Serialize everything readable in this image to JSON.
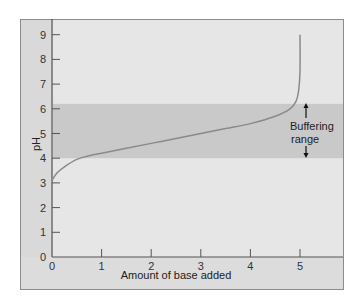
{
  "chart_data": {
    "type": "line",
    "title": "",
    "xlabel": "Amount of base added",
    "ylabel": "pH",
    "xlim": [
      0,
      5.5
    ],
    "ylim": [
      0,
      9.5
    ],
    "x_ticks": [
      "0",
      "1",
      "2",
      "3",
      "4",
      "5"
    ],
    "y_ticks": [
      "0",
      "1",
      "2",
      "3",
      "4",
      "5",
      "6",
      "7",
      "8",
      "9"
    ],
    "grid": false,
    "legend": null,
    "series": [
      {
        "name": "Titration curve",
        "x": [
          0,
          0.1,
          0.25,
          0.5,
          0.75,
          1.0,
          1.5,
          2.0,
          2.5,
          3.0,
          3.5,
          4.0,
          4.5,
          4.8,
          4.92,
          4.97,
          5.0,
          5.0
        ],
        "y": [
          3.1,
          3.4,
          3.65,
          3.95,
          4.1,
          4.2,
          4.4,
          4.6,
          4.8,
          5.0,
          5.2,
          5.4,
          5.7,
          6.0,
          6.3,
          6.7,
          7.5,
          9.0
        ]
      }
    ],
    "shaded_region": {
      "label": "Buffering range",
      "y_from": 4.0,
      "y_to": 6.2
    },
    "annotations": [
      "Buffering",
      "range"
    ]
  },
  "labels": {
    "ylabel": "pH",
    "xlabel": "Amount of base added",
    "annotation_line1": "Buffering",
    "annotation_line2": "range"
  },
  "colors": {
    "background": "#e6e6e6",
    "band": "#c9c9c9",
    "curve": "#8a8a8a",
    "axis": "#555555"
  }
}
